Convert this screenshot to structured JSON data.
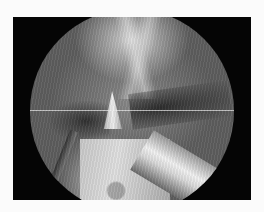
{
  "image": {
    "description": "Grayscale endoscopic surgical view inside circular scope field on black frame",
    "colors": {
      "page_background": "#fbfbfb",
      "frame": "#050505",
      "tissue_mid": "#8a8a8a",
      "instrument_highlight": "#f2f2f2"
    }
  }
}
